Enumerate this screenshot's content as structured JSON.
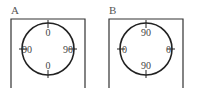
{
  "panels": [
    {
      "label": "A",
      "top": "0",
      "bottom": "0",
      "left": "90",
      "right": "90"
    },
    {
      "label": "B",
      "top": "90",
      "bottom": "90",
      "left": "0",
      "right": "0"
    }
  ],
  "colors": {
    "stroke": "#333333",
    "text": "#444444"
  }
}
